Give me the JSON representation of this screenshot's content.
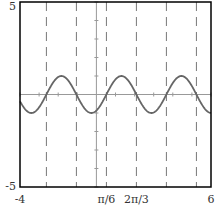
{
  "chart_data": {
    "type": "line",
    "title": "",
    "xlabel": "",
    "ylabel": "",
    "xlim": [
      -4,
      6
    ],
    "ylim": [
      -5,
      5
    ],
    "grid": false,
    "legend": null,
    "function": "y = sin(2(x - π/6))",
    "series": [
      {
        "name": "sin(2(x - π/6))",
        "color": "#666666",
        "amplitude": 1,
        "period": 3.14159,
        "phase_shift": 0.5236,
        "x": [
          -4,
          -3.5,
          -3,
          -2.618,
          -2.225,
          -1.833,
          -1.44,
          -1.047,
          -0.655,
          -0.262,
          0,
          0.131,
          0.524,
          0.916,
          1.309,
          1.702,
          2.094,
          2.487,
          2.88,
          3.272,
          3.665,
          4.058,
          4.451,
          4.843,
          5.236,
          5.629,
          6
        ],
        "y": [
          -0.43,
          -0.59,
          0.54,
          0,
          0.71,
          1.0,
          0.71,
          0,
          -0.71,
          -1.0,
          -0.87,
          -0.71,
          0,
          0.71,
          1.0,
          0.71,
          0,
          -0.71,
          -1.0,
          -0.71,
          0,
          0.71,
          1.0,
          0.71,
          0,
          -0.71,
          -0.79
        ]
      }
    ],
    "vertical_dashed_lines": {
      "color": "#777777",
      "x": [
        -2.618,
        -1.047,
        0.524,
        2.094,
        3.665,
        5.236
      ],
      "meaning": "zeros of the curve at x = π/6 + kπ/2"
    },
    "x_tick_labels": [
      {
        "value": -4,
        "label": "-4"
      },
      {
        "value": 0.5236,
        "label": "π/6"
      },
      {
        "value": 2.0944,
        "label": "2π/3"
      },
      {
        "value": 6,
        "label": "6"
      }
    ],
    "y_tick_labels": [
      {
        "value": 5,
        "label": "5"
      },
      {
        "value": -5,
        "label": "-5"
      }
    ],
    "minor_ticks": {
      "x_step": 1,
      "y_step": 1
    }
  },
  "colors": {
    "frame": "#000000",
    "axes": "#999999",
    "curve": "#666666",
    "dashes": "#777777",
    "background": "#ffffff"
  }
}
